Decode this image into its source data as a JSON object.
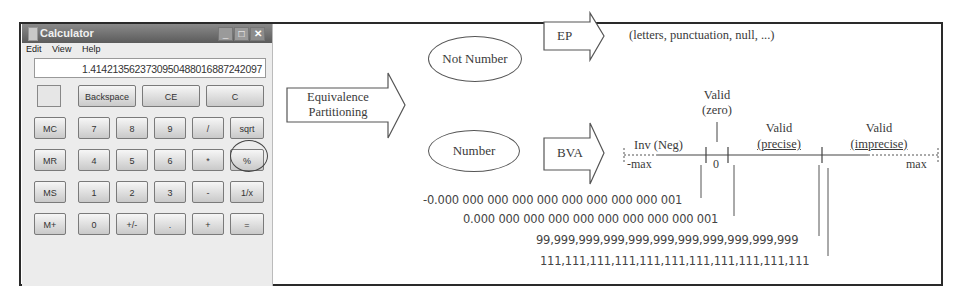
{
  "calculator": {
    "title": "Calculator",
    "window_controls": {
      "minimize": "_",
      "maximize": "□",
      "close": "✕"
    },
    "menu": [
      "Edit",
      "View",
      "Help"
    ],
    "display_value": "1.4142135623730950488016887242097",
    "top_row": [
      "Backspace",
      "CE",
      "C"
    ],
    "rows": [
      [
        "MC",
        "7",
        "8",
        "9",
        "/",
        "sqrt"
      ],
      [
        "MR",
        "4",
        "5",
        "6",
        "*",
        "%"
      ],
      [
        "MS",
        "1",
        "2",
        "3",
        "-",
        "1/x"
      ],
      [
        "M+",
        "0",
        "+/-",
        ".",
        "+",
        "="
      ]
    ],
    "highlighted_button": "sqrt"
  },
  "diagram": {
    "root_arrow": {
      "line1": "Equivalence",
      "line2": "Partitioning"
    },
    "not_number": {
      "label": "Not Number",
      "technique": "EP",
      "examples": "(letters, punctuation, null, ...)"
    },
    "number": {
      "label": "Number",
      "technique": "BVA"
    },
    "number_line": {
      "zones": [
        {
          "line1": "",
          "line2": "Inv (Neg)"
        },
        {
          "line1": "Valid",
          "line2": "(zero)"
        },
        {
          "line1": "Valid",
          "line2": "(precise)"
        },
        {
          "line1": "Valid",
          "line2": "(imprecise)"
        }
      ],
      "min_label": "-max",
      "zero_label": "0",
      "max_label": "max"
    },
    "boundary_values": [
      "-0.000 000 000 000 000 000 000 000 000 001",
      "0.000 000 000 000 000 000 000 000 000 001",
      "99,999,999,999,999,999,999,999,999,999,999",
      "111,111,111,111,111,111,111,111,111,111,111"
    ]
  }
}
